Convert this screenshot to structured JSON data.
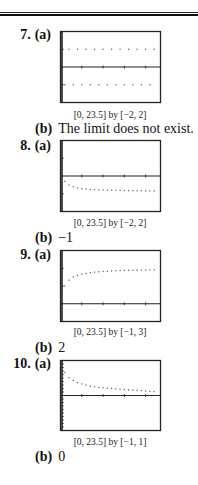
{
  "problems": [
    {
      "number": "7.",
      "part_a": "(a)",
      "caption": "[0, 23.5] by [−2, 2]",
      "part_b": "(b)",
      "answer_b": "The limit does not exist."
    },
    {
      "number": "8.",
      "part_a": "(a)",
      "caption": "[0, 23.5] by [−2, 2]",
      "part_b": "(b)",
      "answer_b": "−1"
    },
    {
      "number": "9.",
      "part_a": "(a)",
      "caption": "[0, 23.5] by [−1, 3]",
      "part_b": "(b)",
      "answer_b": "2"
    },
    {
      "number": "10.",
      "part_a": "(a)",
      "caption": "[0, 23.5] by [−1, 1]",
      "part_b": "(b)",
      "answer_b": "0"
    }
  ],
  "colors": {
    "text": "#111111",
    "frame": "#222222",
    "dots": "#555555",
    "background": "#ffffff"
  },
  "chart_data": [
    {
      "type": "scatter",
      "title": "7(a)",
      "xlabel": "",
      "ylabel": "",
      "xlim": [
        0,
        23.5
      ],
      "ylim": [
        -2,
        2
      ],
      "xticks": [
        5,
        10,
        15,
        20
      ],
      "yticks": [
        -1,
        1
      ],
      "grid": false,
      "x": [
        1,
        2,
        3,
        4,
        5,
        6,
        7,
        8,
        9,
        10,
        11,
        12,
        13,
        14,
        15,
        16,
        17,
        18,
        19,
        20,
        21,
        22
      ],
      "y": [
        -1,
        1,
        -1,
        1,
        -1,
        1,
        -1,
        1,
        -1,
        1,
        -1,
        1,
        -1,
        1,
        -1,
        1,
        -1,
        1,
        -1,
        1,
        -1,
        1
      ]
    },
    {
      "type": "scatter",
      "title": "8(a)",
      "xlabel": "",
      "ylabel": "",
      "xlim": [
        0,
        23.5
      ],
      "ylim": [
        -2,
        2
      ],
      "xticks": [
        5,
        10,
        15,
        20
      ],
      "yticks": [
        -1,
        1
      ],
      "grid": false,
      "x": [
        1,
        2,
        3,
        4,
        5,
        6,
        7,
        8,
        9,
        10,
        11,
        12,
        13,
        14,
        15,
        16,
        17,
        18,
        19,
        20,
        21,
        22
      ],
      "y": [
        -0.3,
        -0.5,
        -0.6,
        -0.67,
        -0.71,
        -0.74,
        -0.76,
        -0.77,
        -0.78,
        -0.79,
        -0.8,
        -0.8,
        -0.81,
        -0.81,
        -0.82,
        -0.82,
        -0.83,
        -0.83,
        -0.83,
        -0.84,
        -0.84,
        -0.84
      ]
    },
    {
      "type": "scatter",
      "title": "9(a)",
      "xlabel": "",
      "ylabel": "",
      "xlim": [
        0,
        23.5
      ],
      "ylim": [
        -1,
        3
      ],
      "xticks": [
        5,
        10,
        15,
        20
      ],
      "yticks": [
        -1,
        1,
        2
      ],
      "grid": false,
      "x": [
        1,
        2,
        3,
        4,
        5,
        6,
        7,
        8,
        9,
        10,
        11,
        12,
        13,
        14,
        15,
        16,
        17,
        18,
        19,
        20,
        21,
        22
      ],
      "y": [
        1,
        1.33,
        1.5,
        1.6,
        1.67,
        1.71,
        1.75,
        1.78,
        1.8,
        1.82,
        1.83,
        1.85,
        1.86,
        1.87,
        1.88,
        1.88,
        1.89,
        1.89,
        1.9,
        1.9,
        1.91,
        1.91
      ]
    },
    {
      "type": "scatter",
      "title": "10(a)",
      "xlabel": "",
      "ylabel": "",
      "xlim": [
        0,
        23.5
      ],
      "ylim": [
        -1,
        1
      ],
      "xticks": [
        5,
        10,
        15,
        20
      ],
      "yticks": [
        -0.9,
        -0.8,
        -0.7,
        -0.6,
        -0.5,
        -0.4,
        -0.3,
        -0.2,
        -0.1,
        0.1,
        0.2,
        0.3,
        0.4,
        0.5,
        0.6,
        0.7,
        0.8,
        0.9
      ],
      "grid": false,
      "x": [
        1,
        2,
        3,
        4,
        5,
        6,
        7,
        8,
        9,
        10,
        11,
        12,
        13,
        14,
        15,
        16,
        17,
        18,
        19,
        20,
        21,
        22
      ],
      "y": [
        0.66,
        0.51,
        0.43,
        0.37,
        0.33,
        0.3,
        0.27,
        0.25,
        0.23,
        0.22,
        0.21,
        0.2,
        0.19,
        0.18,
        0.17,
        0.16,
        0.15,
        0.15,
        0.14,
        0.13,
        0.12,
        0.11
      ]
    }
  ]
}
